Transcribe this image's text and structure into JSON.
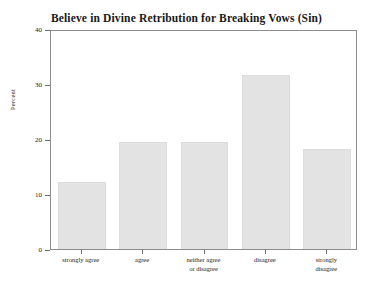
{
  "chart_data": {
    "type": "bar",
    "title": "Believe in Divine Retribution for Breaking Vows (Sin)",
    "xlabel": "",
    "ylabel": "Percent",
    "categories": [
      "strongly agree",
      "agree",
      "neither agree\nor disagree",
      "disagree",
      "strongly\ndisagree"
    ],
    "values": [
      12.2,
      19.5,
      19.4,
      31.6,
      18.2
    ],
    "ylim": [
      0,
      40
    ],
    "yticks": [
      0,
      10,
      20,
      30,
      40
    ],
    "ytick_labels": [
      "0",
      "10",
      "20",
      "30",
      "40"
    ],
    "grid": false,
    "legend": false,
    "bar_color": "#e3e3e3",
    "bar_edge_color": "#dcdcdc",
    "frame_color": "#8d8d8d",
    "background_color": "#ffffff"
  }
}
